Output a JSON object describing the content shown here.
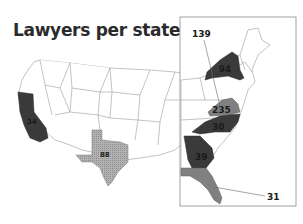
{
  "title": "Lawyers per state",
  "colors": {
    "dark": "#3a3a3a",
    "medium": "#808080",
    "halftone": "#a6a6a6",
    "border": "#9a9a9a",
    "frame": "#8a8a8a",
    "label": "#1a1a1a"
  },
  "states": [
    {
      "state": "California",
      "value": "34",
      "shade": "dark"
    },
    {
      "state": "Texas",
      "value": "88",
      "shade": "halftone"
    },
    {
      "state": "New York",
      "value": "94",
      "shade": "dark"
    },
    {
      "state": "Virginia",
      "value": "235",
      "shade": "medium"
    },
    {
      "state": "North Carolina",
      "value": "30",
      "shade": "dark"
    },
    {
      "state": "Georgia",
      "value": "39",
      "shade": "dark"
    },
    {
      "state": "Florida",
      "value": "31",
      "shade": "medium"
    }
  ],
  "callouts": [
    {
      "value": "139",
      "target": "Mid-Atlantic (leader line)"
    },
    {
      "value": "31",
      "target": "Florida (leader line)"
    }
  ],
  "inset": {
    "label": "East Coast inset"
  }
}
